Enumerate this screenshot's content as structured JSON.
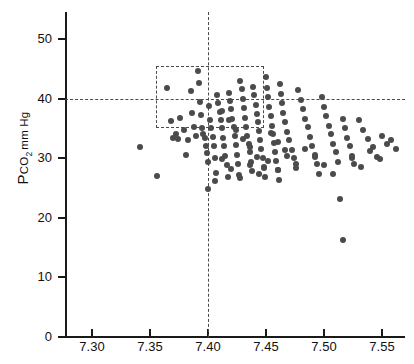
{
  "figure": {
    "background": "#ffffff",
    "point_color": "#4b4b4b",
    "axis_color": "#1a1a1a",
    "dash_color": "#4a4a4a"
  },
  "chart_data": {
    "type": "scatter",
    "title": "",
    "xlabel": "",
    "ylabel": "PCO2 mm Hg",
    "ylabel_parts": {
      "lead": "P",
      "sub_text": "CO",
      "sub_num": "2",
      "unit": "mm Hg"
    },
    "xlim": [
      7.275,
      7.575
    ],
    "ylim": [
      0,
      54.7
    ],
    "grid": false,
    "legend": null,
    "xticks": [
      7.3,
      7.35,
      7.4,
      7.45,
      7.5,
      7.55
    ],
    "xtick_labels": [
      "7.30",
      "7.35",
      "7.40",
      "7.45",
      "7.50",
      "7.55"
    ],
    "yticks": [
      0,
      10,
      20,
      30,
      40,
      50
    ],
    "ytick_labels": [
      "0",
      "10",
      "20",
      "30",
      "40",
      "50"
    ],
    "annotations": {
      "reference_hline": {
        "y": 40,
        "style": "dashed"
      },
      "reference_vline": {
        "x": 7.4,
        "style": "dashed"
      },
      "normal_range_box": {
        "x0": 7.355,
        "x1": 7.448,
        "y0": 35.1,
        "y1": 45.5,
        "style": "dashed"
      }
    },
    "x": [
      7.341,
      7.356,
      7.365,
      7.368,
      7.37,
      7.372,
      7.374,
      7.376,
      7.379,
      7.381,
      7.383,
      7.385,
      7.386,
      7.388,
      7.39,
      7.391,
      7.392,
      7.393,
      7.394,
      7.395,
      7.396,
      7.397,
      7.398,
      7.399,
      7.4,
      7.401,
      7.402,
      7.403,
      7.404,
      7.405,
      7.406,
      7.407,
      7.408,
      7.409,
      7.41,
      7.411,
      7.412,
      7.413,
      7.414,
      7.415,
      7.416,
      7.417,
      7.418,
      7.419,
      7.42,
      7.421,
      7.422,
      7.423,
      7.424,
      7.425,
      7.426,
      7.427,
      7.428,
      7.429,
      7.43,
      7.431,
      7.432,
      7.433,
      7.434,
      7.435,
      7.436,
      7.437,
      7.438,
      7.439,
      7.44,
      7.441,
      7.442,
      7.443,
      7.444,
      7.445,
      7.446,
      7.447,
      7.448,
      7.449,
      7.45,
      7.451,
      7.452,
      7.453,
      7.454,
      7.455,
      7.456,
      7.457,
      7.458,
      7.459,
      7.46,
      7.461,
      7.462,
      7.463,
      7.464,
      7.465,
      7.466,
      7.468,
      7.47,
      7.472,
      7.474,
      7.476,
      7.478,
      7.48,
      7.482,
      7.484,
      7.486,
      7.488,
      7.49,
      7.492,
      7.494,
      7.496,
      7.498,
      7.5,
      7.502,
      7.504,
      7.506,
      7.508,
      7.51,
      7.512,
      7.514,
      7.516,
      7.518,
      7.52,
      7.522,
      7.524,
      7.526,
      7.53,
      7.534,
      7.538,
      7.542,
      7.546,
      7.55,
      7.554,
      7.558,
      7.562,
      7.412,
      7.418,
      7.424,
      7.43,
      7.436,
      7.442,
      7.448,
      7.454,
      7.46,
      7.466,
      7.4,
      7.406,
      7.412,
      7.42,
      7.428,
      7.436,
      7.444,
      7.452,
      7.46,
      7.468,
      7.476,
      7.484,
      7.492,
      7.5,
      7.508,
      7.516,
      7.524,
      7.532,
      7.54,
      7.548
    ],
    "y": [
      31.8,
      27.0,
      41.8,
      36.2,
      33.4,
      34.0,
      33.2,
      36.8,
      34.8,
      30.6,
      33.0,
      41.2,
      37.6,
      35.2,
      33.8,
      44.6,
      42.6,
      39.4,
      37.2,
      35.0,
      34.0,
      33.4,
      32.0,
      30.8,
      29.4,
      38.8,
      36.4,
      35.0,
      33.6,
      32.0,
      30.0,
      27.6,
      40.6,
      39.2,
      37.8,
      36.4,
      35.0,
      33.4,
      32.0,
      30.4,
      28.8,
      26.8,
      41.0,
      39.6,
      38.2,
      36.6,
      35.2,
      33.8,
      32.2,
      30.6,
      29.0,
      27.2,
      43.0,
      41.6,
      40.0,
      38.4,
      36.8,
      35.2,
      33.8,
      32.4,
      31.0,
      29.4,
      27.8,
      42.0,
      40.6,
      39.0,
      37.4,
      36.0,
      34.6,
      33.0,
      31.6,
      30.0,
      28.4,
      26.8,
      43.6,
      41.8,
      40.2,
      38.6,
      37.0,
      35.4,
      34.0,
      32.6,
      31.0,
      29.6,
      28.0,
      26.4,
      42.4,
      40.8,
      39.2,
      37.6,
      36.0,
      34.4,
      33.0,
      31.4,
      30.0,
      28.4,
      41.4,
      39.8,
      38.2,
      36.6,
      35.2,
      33.6,
      32.0,
      30.6,
      29.0,
      27.4,
      40.2,
      38.6,
      37.0,
      35.4,
      34.0,
      32.4,
      31.0,
      29.4,
      23.2,
      36.6,
      35.0,
      33.4,
      32.0,
      30.4,
      29.0,
      36.4,
      34.8,
      33.2,
      31.8,
      30.2,
      33.8,
      32.4,
      33.0,
      31.6,
      38.0,
      36.4,
      34.8,
      33.2,
      31.8,
      30.2,
      28.6,
      34.2,
      32.8,
      31.4,
      24.8,
      26.2,
      29.8,
      28.2,
      26.6,
      28.8,
      27.4,
      29.6,
      28.0,
      30.4,
      29.0,
      31.6,
      30.2,
      28.8,
      27.4,
      16.2,
      30.0,
      28.6,
      31.2,
      29.8
    ],
    "n_points": 160
  }
}
